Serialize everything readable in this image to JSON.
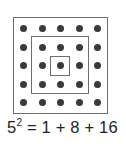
{
  "diagram": {
    "grid_rows": 5,
    "grid_cols": 5,
    "dot_color": "#3a3a3a",
    "box_color": "#6e6e6e",
    "squares": [
      "inner-1x1",
      "middle-3x3",
      "outer-5x5"
    ]
  },
  "equation": {
    "base": "5",
    "exponent": "2",
    "rhs": " = 1 + 8 + 16"
  }
}
